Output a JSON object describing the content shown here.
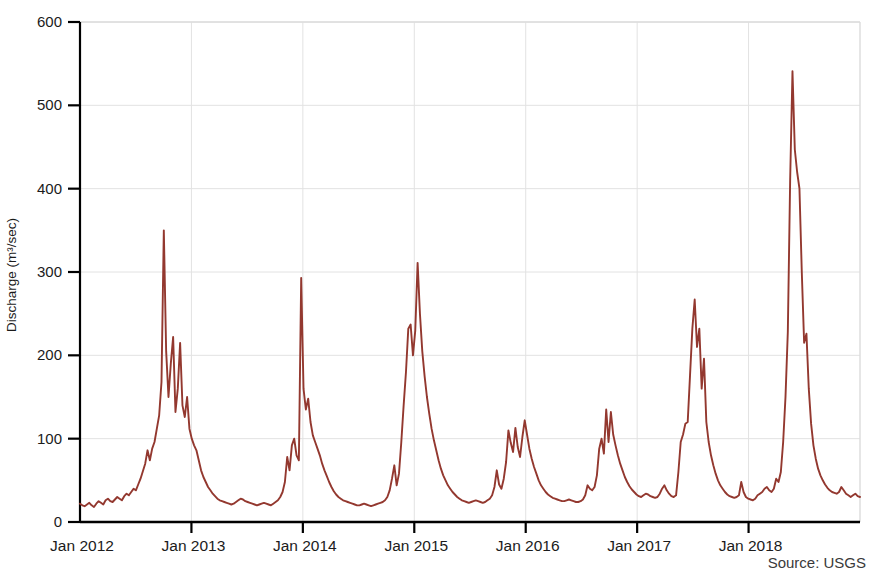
{
  "chart_data": {
    "type": "line",
    "title": "",
    "xlabel": "",
    "ylabel": "Discharge (m³/sec)",
    "ylim": [
      0,
      600
    ],
    "yticks": [
      0,
      100,
      200,
      300,
      400,
      500,
      600
    ],
    "ytick_labels": [
      "0",
      "100",
      "200",
      "300",
      "400",
      "500",
      "600"
    ],
    "xlim": [
      "Jan 2012",
      "Dec 2018"
    ],
    "xticks": [
      "Jan 2012",
      "Jan 2013",
      "Jan 2014",
      "Jan 2015",
      "Jan 2016",
      "Jan 2017",
      "Jan 2018"
    ],
    "grid": true,
    "legend": "none",
    "series": [
      {
        "name": "Discharge",
        "color": "#93382f",
        "units": "m3/sec",
        "sampling": "daily (approx. weekly points)",
        "x_start": "2012-01-01",
        "x_end": "2018-12-20",
        "annual_peaks": [
          {
            "year": 2012,
            "peak": 350,
            "secondary_peaks": [
              222,
              215,
              195
            ]
          },
          {
            "year": 2013,
            "peak": 293,
            "secondary_peaks": [
              185,
              100
            ]
          },
          {
            "year": 2014,
            "peak": 311,
            "secondary_peaks": [
              237,
              232,
              150
            ]
          },
          {
            "year": 2015,
            "peak": 122,
            "secondary_peaks": [
              113,
              110,
              62
            ]
          },
          {
            "year": 2016,
            "peak": 135,
            "secondary_peaks": [
              132,
              100,
              88
            ]
          },
          {
            "year": 2017,
            "peak": 267,
            "secondary_peaks": [
              232,
              176,
              120
            ]
          },
          {
            "year": 2018,
            "peak": 541,
            "secondary_peaks": [
              447,
              410,
              228,
              215
            ]
          }
        ],
        "baseflow_range": [
          17,
          32
        ],
        "values": [
          22,
          20,
          19,
          21,
          23,
          20,
          18,
          22,
          25,
          23,
          21,
          26,
          28,
          25,
          24,
          27,
          30,
          28,
          26,
          31,
          34,
          32,
          36,
          40,
          38,
          45,
          52,
          61,
          70,
          86,
          74,
          88,
          96,
          112,
          128,
          168,
          350,
          205,
          150,
          190,
          222,
          132,
          160,
          215,
          140,
          126,
          150,
          112,
          100,
          92,
          86,
          74,
          62,
          54,
          48,
          42,
          38,
          34,
          31,
          28,
          26,
          25,
          24,
          23,
          22,
          21,
          22,
          24,
          26,
          28,
          27,
          25,
          24,
          23,
          22,
          21,
          20,
          21,
          22,
          23,
          22,
          21,
          20,
          22,
          24,
          26,
          30,
          36,
          48,
          78,
          62,
          92,
          100,
          80,
          74,
          293,
          160,
          135,
          148,
          120,
          104,
          96,
          88,
          80,
          70,
          62,
          55,
          48,
          42,
          37,
          33,
          30,
          28,
          26,
          25,
          24,
          23,
          22,
          21,
          20,
          20,
          21,
          22,
          21,
          20,
          19,
          20,
          21,
          22,
          23,
          24,
          26,
          30,
          38,
          52,
          68,
          44,
          58,
          96,
          140,
          180,
          232,
          237,
          200,
          230,
          311,
          250,
          205,
          175,
          150,
          130,
          112,
          98,
          86,
          74,
          64,
          56,
          50,
          44,
          40,
          36,
          33,
          30,
          28,
          26,
          25,
          24,
          23,
          24,
          25,
          26,
          25,
          24,
          23,
          24,
          26,
          28,
          32,
          42,
          62,
          45,
          40,
          52,
          72,
          110,
          95,
          84,
          113,
          90,
          78,
          102,
          122,
          105,
          88,
          76,
          66,
          58,
          50,
          44,
          40,
          36,
          33,
          31,
          29,
          28,
          27,
          26,
          25,
          25,
          26,
          27,
          26,
          25,
          24,
          24,
          25,
          27,
          32,
          44,
          40,
          38,
          42,
          56,
          88,
          100,
          82,
          135,
          96,
          132,
          105,
          92,
          80,
          70,
          62,
          54,
          48,
          43,
          39,
          36,
          33,
          31,
          30,
          32,
          34,
          33,
          31,
          30,
          29,
          30,
          34,
          40,
          44,
          38,
          34,
          31,
          30,
          32,
          60,
          96,
          105,
          118,
          120,
          176,
          232,
          267,
          210,
          232,
          160,
          196,
          120,
          96,
          80,
          68,
          58,
          50,
          44,
          40,
          36,
          33,
          31,
          30,
          29,
          30,
          32,
          48,
          36,
          30,
          28,
          27,
          26,
          28,
          32,
          34,
          36,
          40,
          42,
          38,
          36,
          40,
          52,
          48,
          60,
          96,
          150,
          228,
          410,
          541,
          447,
          420,
          400,
          300,
          215,
          226,
          160,
          118,
          92,
          76,
          64,
          56,
          50,
          45,
          41,
          38,
          36,
          35,
          34,
          36,
          42,
          38,
          34,
          32,
          30,
          32,
          34,
          31,
          30
        ]
      }
    ]
  },
  "axes": {
    "y_label": "Discharge (m³/sec)",
    "y_tick_labels": [
      "600",
      "500",
      "400",
      "300",
      "200",
      "100",
      "0"
    ],
    "x_tick_labels": [
      "Jan 2012",
      "Jan 2013",
      "Jan 2014",
      "Jan 2015",
      "Jan 2016",
      "Jan 2017",
      "Jan 2018"
    ]
  },
  "footer": {
    "source": "Source: USGS"
  },
  "style": {
    "line_color": "#93382f",
    "axis_color": "#000000",
    "grid_color": "#e2e2e2",
    "text_color": "#1b1b1b",
    "background": "#ffffff"
  }
}
